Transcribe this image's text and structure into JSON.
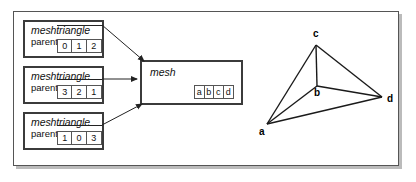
{
  "figure": {
    "background": "#ffffff",
    "frame_color": "#555555",
    "box_border_color": "#3b3b3b",
    "line_color": "#222222"
  },
  "structs": [
    {
      "type_name": "meshtriangle",
      "field_label": "parent",
      "cells": [
        "0",
        "1",
        "2"
      ]
    },
    {
      "type_name": "meshtriangle",
      "field_label": "parent",
      "cells": [
        "3",
        "2",
        "1"
      ]
    },
    {
      "type_name": "meshtriangle",
      "field_label": "parent",
      "cells": [
        "1",
        "0",
        "3"
      ]
    }
  ],
  "mesh": {
    "type_name": "mesh",
    "cells": [
      "a",
      "b",
      "c",
      "d"
    ]
  },
  "graph": {
    "vertices": [
      {
        "label": "a",
        "x": 267,
        "y": 124,
        "label_x": 259,
        "label_y": 127
      },
      {
        "label": "b",
        "x": 317,
        "y": 86,
        "label_x": 314,
        "label_y": 88
      },
      {
        "label": "c",
        "x": 316,
        "y": 45,
        "label_x": 313,
        "label_y": 29
      },
      {
        "label": "d",
        "x": 382,
        "y": 97,
        "label_x": 387,
        "label_y": 94
      }
    ],
    "edges": [
      {
        "from": "a",
        "to": "c"
      },
      {
        "from": "a",
        "to": "b"
      },
      {
        "from": "a",
        "to": "d"
      },
      {
        "from": "c",
        "to": "b"
      },
      {
        "from": "c",
        "to": "d"
      },
      {
        "from": "b",
        "to": "d"
      }
    ]
  },
  "arrows": [
    {
      "name": "parent-arrow-1",
      "x1": 104,
      "y1": 31,
      "x2": 146,
      "y2": 62
    },
    {
      "name": "parent-arrow-2",
      "x1": 104,
      "y1": 85,
      "x2": 140,
      "y2": 85
    },
    {
      "name": "parent-arrow-3",
      "x1": 104,
      "y1": 131,
      "x2": 144,
      "y2": 104
    }
  ]
}
